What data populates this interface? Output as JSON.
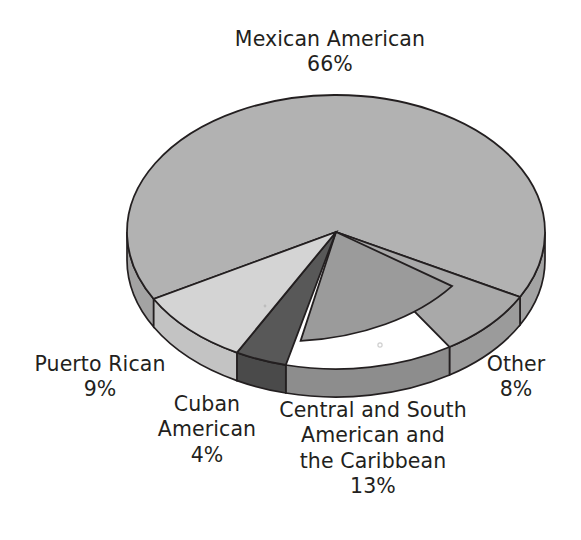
{
  "chart_data": {
    "type": "pie",
    "title": "",
    "subtitle": "",
    "xlabel": "",
    "ylabel": "",
    "style": "3d-exploded-flat",
    "grid": false,
    "legend_position": "none",
    "labels_outside": true,
    "total_percent": 100,
    "categories": [
      "Mexican American",
      "Other",
      "Central and South American and the Caribbean",
      "Cuban American",
      "Puerto Rican"
    ],
    "values": [
      66,
      8,
      13,
      4,
      9
    ],
    "slices": [
      {
        "name": "Mexican American",
        "label_lines": [
          "Mexican American"
        ],
        "value": 66,
        "value_text": "66%",
        "color": "#b2b2b2",
        "side_color": "#a3a3a3",
        "label_position": "top"
      },
      {
        "name": "Other",
        "label_lines": [
          "Other"
        ],
        "value": 8,
        "value_text": "8%",
        "color": "#a9a9a9",
        "side_color": "#9b9b9b",
        "label_position": "right"
      },
      {
        "name": "Central and South American and the Caribbean",
        "label_lines": [
          "Central and South",
          "American and",
          "the Caribbean"
        ],
        "value": 13,
        "value_text": "13%",
        "color": "#9b9b9b",
        "side_color": "#8d8d8d",
        "label_position": "bottom"
      },
      {
        "name": "Cuban American",
        "label_lines": [
          "Cuban",
          "American"
        ],
        "value": 4,
        "value_text": "4%",
        "color": "#585858",
        "side_color": "#4a4a4a",
        "label_position": "bottom-left"
      },
      {
        "name": "Puerto Rican",
        "label_lines": [
          "Puerto Rican"
        ],
        "value": 9,
        "value_text": "9%",
        "color": "#d4d4d4",
        "side_color": "#c3c3c3",
        "label_position": "left"
      }
    ],
    "outline_color": "#231f20",
    "background_color": "#ffffff"
  },
  "labels": {
    "mexican": {
      "name": "Mexican American",
      "pct": "66%"
    },
    "puerto": {
      "name": "Puerto Rican",
      "pct": "9%"
    },
    "cuban": {
      "line1": "Cuban",
      "line2": "American",
      "pct": "4%"
    },
    "central": {
      "line1": "Central and South",
      "line2": "American and",
      "line3": "the Caribbean",
      "pct": "13%"
    },
    "other": {
      "name": "Other",
      "pct": "8%"
    }
  }
}
